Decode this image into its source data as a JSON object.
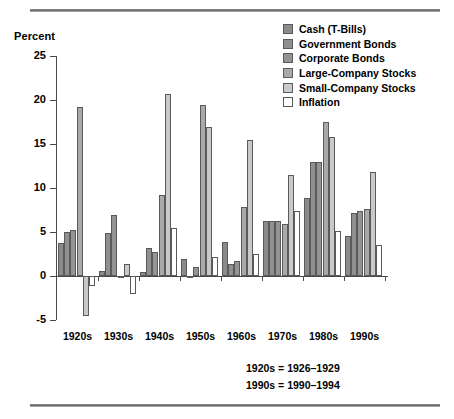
{
  "chart_data": {
    "type": "bar",
    "title": "",
    "ylabel": "Percent",
    "xlabel": "",
    "ylim": [
      -5,
      25
    ],
    "yticks": [
      25,
      20,
      15,
      10,
      5,
      0,
      -5
    ],
    "grid": false,
    "legend_position": "top-right",
    "categories": [
      "1920s",
      "1930s",
      "1940s",
      "1950s",
      "1960s",
      "1970s",
      "1980s",
      "1990s"
    ],
    "series": [
      {
        "name": "Cash (T-Bills)",
        "color": "#8a8a8a",
        "values": [
          3.7,
          0.6,
          0.4,
          1.9,
          3.9,
          6.3,
          8.9,
          4.5
        ]
      },
      {
        "name": "Government Bonds",
        "color": "#8f8f8f",
        "values": [
          5.0,
          4.9,
          3.2,
          -0.1,
          1.4,
          6.2,
          12.9,
          7.2
        ]
      },
      {
        "name": "Corporate Bonds",
        "color": "#949494",
        "values": [
          5.2,
          6.9,
          2.7,
          1.0,
          1.7,
          6.2,
          13.0,
          7.4
        ]
      },
      {
        "name": "Large-Company Stocks",
        "color": "#a9a9a9",
        "values": [
          19.2,
          -0.1,
          9.2,
          19.4,
          7.8,
          5.9,
          17.5,
          7.6
        ]
      },
      {
        "name": "Small-Company Stocks",
        "color": "#c9c9c9",
        "values": [
          -4.5,
          1.4,
          20.7,
          16.9,
          15.5,
          11.5,
          15.8,
          11.8
        ]
      },
      {
        "name": "Inflation",
        "color": "#ffffff",
        "values": [
          -1.1,
          -2.0,
          5.4,
          2.2,
          2.5,
          7.4,
          5.1,
          3.5
        ]
      }
    ],
    "notes": [
      "1920s = 1926–1929",
      "1990s = 1990–1994"
    ]
  },
  "legend": {
    "items": [
      {
        "label": "Cash (T-Bills)"
      },
      {
        "label": "Government Bonds"
      },
      {
        "label": "Corporate Bonds"
      },
      {
        "label": "Large-Company Stocks"
      },
      {
        "label": "Small-Company Stocks"
      },
      {
        "label": "Inflation"
      }
    ]
  }
}
